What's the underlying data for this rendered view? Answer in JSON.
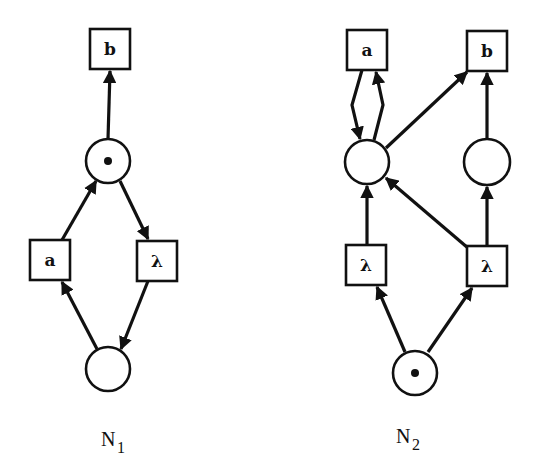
{
  "diagram": {
    "type": "petri-net-comparison",
    "nets": [
      {
        "name": "N",
        "subscript": "1",
        "label_pos": [
          106,
          440
        ],
        "places": [
          {
            "id": "p_top",
            "cx": 108,
            "cy": 161,
            "r": 22,
            "tokens": 1
          },
          {
            "id": "p_bottom",
            "cx": 108,
            "cy": 369,
            "r": 22,
            "tokens": 0
          }
        ],
        "transitions": [
          {
            "id": "t_b",
            "label": "b",
            "cx": 110,
            "cy": 49
          },
          {
            "id": "t_a",
            "label": "a",
            "cx": 50,
            "cy": 260
          },
          {
            "id": "t_lambda",
            "label": "λ",
            "cx": 157,
            "cy": 261
          }
        ]
      },
      {
        "name": "N",
        "subscript": "2",
        "label_pos": [
          403,
          438
        ],
        "places": [
          {
            "id": "p_left",
            "cx": 367,
            "cy": 162,
            "r": 22,
            "tokens": 0
          },
          {
            "id": "p_right",
            "cx": 487,
            "cy": 162,
            "r": 23,
            "tokens": 0
          },
          {
            "id": "p_bottom",
            "cx": 415,
            "cy": 373,
            "r": 22,
            "tokens": 1
          }
        ],
        "transitions": [
          {
            "id": "t_a",
            "label": "a",
            "cx": 367,
            "cy": 50
          },
          {
            "id": "t_b",
            "label": "b",
            "cx": 487,
            "cy": 51
          },
          {
            "id": "t_lambda_left",
            "label": "λ",
            "cx": 366,
            "cy": 265
          },
          {
            "id": "t_lambda_right",
            "label": "λ",
            "cx": 487,
            "cy": 266
          }
        ]
      }
    ],
    "transition_size": 40,
    "colors": {
      "ink": "#111111",
      "background": "#ffffff"
    }
  }
}
